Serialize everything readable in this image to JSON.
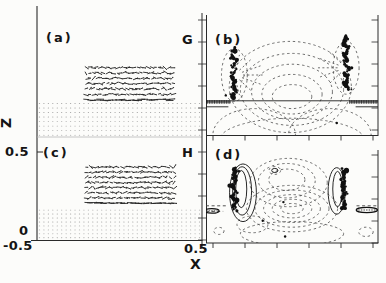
{
  "figure": {
    "background": "#fcfcfa",
    "ink": "#1c1c1c",
    "grid_dot_color": "#8f8f8f",
    "dashed_contour_color": "#3f3f3f"
  },
  "axes": {
    "x": {
      "label": "X",
      "left_tick": "-0.5",
      "right_tick": "0.5",
      "range": [
        -0.5,
        0.5
      ]
    },
    "z": {
      "label": "Z",
      "top_tick": "0.5",
      "bottom_tick": "0",
      "range": [
        0,
        0.5
      ]
    }
  },
  "chart_data": {
    "type": "multi-panel",
    "panel_types": [
      "quiver",
      "contour",
      "quiver",
      "contour"
    ],
    "panels": [
      {
        "id": "a",
        "label": "(a)",
        "corner_label": "G",
        "type": "quiver",
        "seed": 11,
        "cluster": {
          "x0": 0.3,
          "x1": 0.82,
          "y0": 0.44,
          "y1": 0.7,
          "rows": 7,
          "cols": 26
        },
        "grid": {
          "x0": 0.015,
          "x1": 0.985,
          "y0": 0.73,
          "y1": 0.985,
          "rows": 8,
          "cols": 37
        }
      },
      {
        "id": "b",
        "label": "(b)",
        "type": "contour",
        "seed": 22,
        "features": [
          {
            "kind": "ellipse",
            "cx": 0.5,
            "cy": 0.68,
            "rx": 0.115,
            "ry": 0.1,
            "style": "dashed"
          },
          {
            "kind": "ellipse",
            "cx": 0.5,
            "cy": 0.66,
            "rx": 0.175,
            "ry": 0.165,
            "style": "dashed"
          },
          {
            "kind": "ellipse",
            "cx": 0.5,
            "cy": 0.64,
            "rx": 0.235,
            "ry": 0.23,
            "style": "dashed"
          },
          {
            "kind": "ellipse",
            "cx": 0.5,
            "cy": 0.62,
            "rx": 0.3,
            "ry": 0.3,
            "style": "dashed"
          },
          {
            "kind": "ellipse",
            "cx": 0.49,
            "cy": 0.6,
            "rx": 0.355,
            "ry": 0.38,
            "style": "dashed"
          },
          {
            "kind": "ellipse",
            "cx": 0.165,
            "cy": 0.5,
            "rx": 0.075,
            "ry": 0.22,
            "style": "dashed"
          },
          {
            "kind": "ellipse",
            "cx": 0.815,
            "cy": 0.44,
            "rx": 0.075,
            "ry": 0.22,
            "style": "dashed"
          },
          {
            "kind": "fan",
            "cx": 0.165,
            "cy": 0.5,
            "r0": 0.05,
            "r1": 0.17,
            "a0": -80,
            "a1": 80,
            "n": 7
          },
          {
            "kind": "fan",
            "cx": 0.815,
            "cy": 0.44,
            "r0": 0.05,
            "r1": 0.17,
            "a0": 100,
            "a1": 260,
            "n": 7
          },
          {
            "kind": "ellipse",
            "cx": 0.28,
            "cy": 1.0,
            "rx": 0.24,
            "ry": 0.22,
            "style": "dashed"
          },
          {
            "kind": "ellipse",
            "cx": 0.72,
            "cy": 1.0,
            "rx": 0.24,
            "ry": 0.22,
            "style": "dashed"
          },
          {
            "kind": "ellipse",
            "cx": 0.5,
            "cy": 1.04,
            "rx": 0.42,
            "ry": 0.18,
            "style": "dashed"
          },
          {
            "kind": "hline",
            "y": 0.715,
            "x0": 0.0,
            "x1": 1.0,
            "style": "solid"
          },
          {
            "kind": "hatch",
            "y": 0.725,
            "x0": 0.0,
            "x1": 0.145
          },
          {
            "kind": "hatch",
            "y": 0.725,
            "x0": 0.835,
            "x1": 1.0
          },
          {
            "kind": "hline",
            "y": 0.765,
            "x0": 0.0,
            "x1": 0.13,
            "style": "solid"
          },
          {
            "kind": "hline",
            "y": 0.765,
            "x0": 0.87,
            "x1": 1.0,
            "style": "solid"
          },
          {
            "kind": "blob",
            "cx": 0.165,
            "cy0": 0.27,
            "cy1": 0.7
          },
          {
            "kind": "blob",
            "cx": 0.815,
            "cy0": 0.17,
            "cy1": 0.63
          },
          {
            "kind": "dot",
            "x": 0.115,
            "y": 0.67
          },
          {
            "kind": "dot",
            "x": 0.76,
            "y": 0.9
          }
        ]
      },
      {
        "id": "c",
        "label": "(c)",
        "corner_label": "H",
        "type": "quiver",
        "seed": 33,
        "cluster": {
          "x0": 0.3,
          "x1": 0.83,
          "y0": 0.17,
          "y1": 0.58,
          "rows": 8,
          "cols": 26
        },
        "grid": {
          "x0": 0.015,
          "x1": 0.985,
          "y0": 0.66,
          "y1": 0.975,
          "rows": 8,
          "cols": 37
        }
      },
      {
        "id": "d",
        "label": "(d)",
        "type": "contour",
        "seed": 44,
        "features": [
          {
            "kind": "ellipse",
            "cx": 0.47,
            "cy": 0.32,
            "rx": 0.105,
            "ry": 0.115,
            "style": "dashed"
          },
          {
            "kind": "ellipse",
            "cx": 0.47,
            "cy": 0.33,
            "rx": 0.165,
            "ry": 0.185,
            "style": "dashed"
          },
          {
            "kind": "ellipse",
            "cx": 0.48,
            "cy": 0.35,
            "rx": 0.225,
            "ry": 0.26,
            "style": "dashed"
          },
          {
            "kind": "ellipse",
            "cx": 0.5,
            "cy": 0.63,
            "rx": 0.065,
            "ry": 0.055,
            "style": "dashed"
          },
          {
            "kind": "ellipse",
            "cx": 0.5,
            "cy": 0.63,
            "rx": 0.115,
            "ry": 0.1,
            "style": "dashed"
          },
          {
            "kind": "ellipse",
            "cx": 0.5,
            "cy": 0.63,
            "rx": 0.165,
            "ry": 0.15,
            "style": "dashed"
          },
          {
            "kind": "ellipse",
            "cx": 0.5,
            "cy": 0.63,
            "rx": 0.215,
            "ry": 0.2,
            "style": "dashed"
          },
          {
            "kind": "ellipse",
            "cx": 0.5,
            "cy": 0.63,
            "rx": 0.265,
            "ry": 0.25,
            "style": "dashed"
          },
          {
            "kind": "ellipse",
            "cx": 0.205,
            "cy": 0.42,
            "rx": 0.032,
            "ry": 0.2,
            "style": "solid"
          },
          {
            "kind": "ellipse",
            "cx": 0.21,
            "cy": 0.44,
            "rx": 0.055,
            "ry": 0.26,
            "style": "solid"
          },
          {
            "kind": "ellipse",
            "cx": 0.215,
            "cy": 0.46,
            "rx": 0.078,
            "ry": 0.31,
            "style": "solid"
          },
          {
            "kind": "ellipse",
            "cx": 0.765,
            "cy": 0.42,
            "rx": 0.028,
            "ry": 0.19,
            "style": "solid"
          },
          {
            "kind": "ellipse",
            "cx": 0.76,
            "cy": 0.44,
            "rx": 0.05,
            "ry": 0.25,
            "style": "solid"
          },
          {
            "kind": "ellipse",
            "cx": 0.4,
            "cy": 0.22,
            "rx": 0.018,
            "ry": 0.022,
            "style": "solid"
          },
          {
            "kind": "ellipse",
            "cx": 0.4,
            "cy": 0.22,
            "rx": 0.034,
            "ry": 0.042,
            "style": "dashed"
          },
          {
            "kind": "hline",
            "y": 0.6,
            "x0": 0.0,
            "x1": 0.115,
            "style": "dashed"
          },
          {
            "kind": "hline",
            "y": 0.6,
            "x0": 0.875,
            "x1": 1.0,
            "style": "dashed"
          },
          {
            "kind": "hline",
            "y": 0.66,
            "x0": 0.0,
            "x1": 0.1,
            "style": "dashed"
          },
          {
            "kind": "pill",
            "cx": 0.935,
            "cy": 0.645,
            "rx": 0.062,
            "ry": 0.028
          },
          {
            "kind": "pill",
            "cx": 0.034,
            "cy": 0.655,
            "rx": 0.042,
            "ry": 0.024
          },
          {
            "kind": "ellipse",
            "cx": 0.5,
            "cy": 0.9,
            "rx": 0.3,
            "ry": 0.13,
            "style": "dashed"
          },
          {
            "kind": "ellipse",
            "cx": 0.075,
            "cy": 0.87,
            "rx": 0.03,
            "ry": 0.038,
            "style": "dashed"
          },
          {
            "kind": "ellipse",
            "cx": 0.93,
            "cy": 0.88,
            "rx": 0.042,
            "ry": 0.05,
            "style": "dashed"
          },
          {
            "kind": "ellipse",
            "cx": 0.27,
            "cy": 0.8,
            "rx": 0.09,
            "ry": 0.09,
            "style": "dashed"
          },
          {
            "kind": "blob",
            "cx": 0.165,
            "cy0": 0.19,
            "cy1": 0.67
          },
          {
            "kind": "blob",
            "cx": 0.8,
            "cy0": 0.2,
            "cy1": 0.64
          },
          {
            "kind": "dot",
            "x": 0.45,
            "y": 0.56
          },
          {
            "kind": "dot",
            "x": 0.33,
            "y": 0.76
          },
          {
            "kind": "dot",
            "x": 0.46,
            "y": 0.93
          }
        ]
      }
    ]
  }
}
